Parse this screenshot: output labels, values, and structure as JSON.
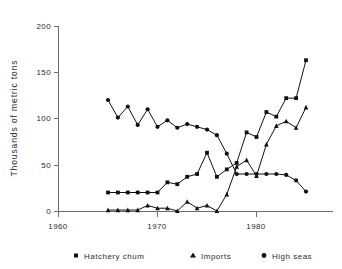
{
  "chart_data": {
    "type": "line",
    "title": "",
    "xlabel": "",
    "ylabel": "Thousands of metric tons",
    "xlim": [
      1960,
      1986
    ],
    "ylim": [
      0,
      200
    ],
    "xticks": [
      1960,
      1970,
      1980
    ],
    "yticks": [
      0,
      50,
      100,
      150,
      200
    ],
    "grid": false,
    "legend_position": "bottom",
    "x": [
      1965,
      1966,
      1967,
      1968,
      1969,
      1970,
      1971,
      1972,
      1973,
      1974,
      1975,
      1976,
      1977,
      1978,
      1979,
      1980,
      1981,
      1982,
      1983,
      1984,
      1985
    ],
    "series": [
      {
        "name": "Hatchery chum",
        "marker": "square",
        "values": [
          20,
          20,
          20,
          20,
          20,
          20,
          31,
          29,
          37,
          40,
          63,
          37,
          45,
          52,
          85,
          80,
          107,
          102,
          122,
          122,
          163
        ]
      },
      {
        "name": "Imports",
        "marker": "triangle",
        "values": [
          1,
          1,
          1,
          1,
          6,
          3,
          3,
          0,
          10,
          3,
          6,
          0,
          18,
          48,
          55,
          38,
          72,
          92,
          97,
          90,
          112
        ]
      },
      {
        "name": "High seas",
        "marker": "circle",
        "values": [
          120,
          101,
          113,
          93,
          110,
          91,
          98,
          90,
          94,
          91,
          88,
          82,
          62,
          40,
          40,
          40,
          40,
          40,
          39,
          33,
          21
        ]
      }
    ]
  },
  "axes": {
    "y_title": "Thousands of metric tons",
    "y_tick_labels": [
      "0",
      "50",
      "100",
      "150",
      "200"
    ],
    "x_tick_labels": [
      "1960",
      "1970",
      "1980"
    ]
  },
  "legend": {
    "entries": [
      {
        "label": "Hatchery chum",
        "marker": "square-marker-icon"
      },
      {
        "label": "Imports",
        "marker": "triangle-marker-icon"
      },
      {
        "label": "High seas",
        "marker": "circle-marker-icon"
      }
    ]
  },
  "colors": {
    "ink": "#111111",
    "axis": "#6e6e6e",
    "background": "#ffffff"
  }
}
